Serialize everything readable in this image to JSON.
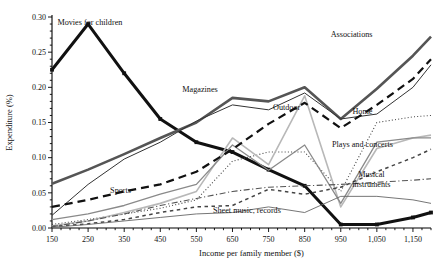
{
  "chart_data": {
    "type": "line",
    "title": "",
    "xlabel": "Income per family member ($)",
    "ylabel": "Expenditure (%)",
    "xlim": [
      150,
      1200
    ],
    "ylim": [
      0.0,
      0.3
    ],
    "grid": false,
    "legend_position": "inline-annotations",
    "xtick_labels": [
      "150",
      "250",
      "350",
      "450",
      "550",
      "650",
      "750",
      "850",
      "950",
      "1,050",
      "1,150"
    ],
    "xticks": [
      150,
      250,
      350,
      450,
      550,
      650,
      750,
      850,
      950,
      1050,
      1150
    ],
    "ytick_labels": [
      "0.00",
      "0.05",
      "0.10",
      "0.15",
      "0.20",
      "0.25",
      "0.30"
    ],
    "yticks": [
      0.0,
      0.05,
      0.1,
      0.15,
      0.2,
      0.25,
      0.3
    ],
    "x": [
      150,
      250,
      350,
      450,
      550,
      650,
      750,
      850,
      950,
      1050,
      1150,
      1200
    ],
    "series": [
      {
        "name": "Movies for children",
        "label": "Movies for children",
        "label_x": 255,
        "label_y": 0.288,
        "style": "solid-thick-black",
        "color": "#111111",
        "width": 3.0,
        "dash": "none",
        "values": [
          0.225,
          0.29,
          0.22,
          0.155,
          0.122,
          0.108,
          0.083,
          0.06,
          0.005,
          0.005,
          0.015,
          0.022
        ]
      },
      {
        "name": "Associations",
        "label": "Associations",
        "label_x": 980,
        "label_y": 0.272,
        "style": "solid-thick-gray",
        "color": "#555555",
        "width": 2.6,
        "dash": "none",
        "values": [
          0.063,
          0.083,
          0.105,
          0.128,
          0.15,
          0.185,
          0.18,
          0.2,
          0.155,
          0.198,
          0.245,
          0.272
        ]
      },
      {
        "name": "Magazines",
        "label": "Magazines",
        "label_x": 560,
        "label_y": 0.193,
        "style": "solid-thin-black",
        "color": "#333333",
        "width": 1.0,
        "dash": "none",
        "values": [
          0.018,
          0.062,
          0.098,
          0.122,
          0.152,
          0.175,
          0.168,
          0.192,
          0.155,
          0.162,
          0.2,
          0.232
        ]
      },
      {
        "name": "Home",
        "label": "Home",
        "label_x": 1010,
        "label_y": 0.162,
        "style": "dotted-thin",
        "color": "#444444",
        "width": 1.1,
        "dash": "1,2.2",
        "values": [
          0.005,
          0.012,
          0.02,
          0.028,
          0.04,
          0.095,
          0.108,
          0.108,
          0.052,
          0.15,
          0.158,
          0.16
        ]
      },
      {
        "name": "Outdoor",
        "label": "Outdoor",
        "label_x": 800,
        "label_y": 0.168,
        "style": "solid-thin-lightgray",
        "color": "#b8b8b8",
        "width": 1.6,
        "dash": "none",
        "values": [
          0.003,
          0.01,
          0.022,
          0.035,
          0.052,
          0.128,
          0.09,
          0.188,
          0.03,
          0.113,
          0.128,
          0.132
        ]
      },
      {
        "name": "Plays and concerts",
        "label": "Plays and concerts",
        "label_x": 1010,
        "label_y": 0.115,
        "style": "solid-thin-mid",
        "color": "#8a8a8a",
        "width": 1.3,
        "dash": "none",
        "values": [
          0.012,
          0.02,
          0.032,
          0.048,
          0.062,
          0.118,
          0.082,
          0.118,
          0.035,
          0.122,
          0.128,
          0.128
        ]
      },
      {
        "name": "Sports",
        "label": "Sports",
        "label_x": 340,
        "label_y": 0.05,
        "style": "dashed-thick",
        "color": "#111111",
        "width": 2.2,
        "dash": "8,5",
        "values": [
          0.03,
          0.04,
          0.052,
          0.062,
          0.08,
          0.112,
          0.148,
          0.178,
          0.142,
          0.175,
          0.212,
          0.24
        ]
      },
      {
        "name": "Musical instruments",
        "label": "Musical instruments",
        "label_x": 1035,
        "label_y": 0.072,
        "style": "dashed-fine",
        "color": "#444444",
        "width": 1.5,
        "dash": "3.5,3.5",
        "values": [
          0.002,
          0.006,
          0.012,
          0.022,
          0.03,
          0.032,
          0.055,
          0.048,
          0.058,
          0.08,
          0.1,
          0.112
        ]
      },
      {
        "name": "Sheet music, records",
        "label": "Sheet music, records",
        "label_x": 690,
        "label_y": 0.022,
        "style": "dash-dot",
        "color": "#555555",
        "width": 1.1,
        "dash": "6,2.5,1.2,2.5",
        "values": [
          0.002,
          0.01,
          0.02,
          0.032,
          0.042,
          0.052,
          0.058,
          0.06,
          0.062,
          0.065,
          0.068,
          0.07
        ]
      },
      {
        "name": "Lower thin solid",
        "label": "",
        "label_x": null,
        "label_y": null,
        "style": "solid-hairline",
        "color": "#666666",
        "width": 0.9,
        "dash": "none",
        "values": [
          0.001,
          0.005,
          0.01,
          0.015,
          0.02,
          0.022,
          0.03,
          0.022,
          0.045,
          0.045,
          0.04,
          0.035
        ]
      }
    ]
  }
}
